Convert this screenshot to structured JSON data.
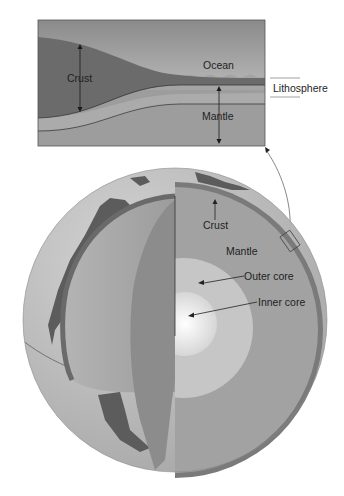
{
  "figure": {
    "inset": {
      "labels": {
        "crust": "Crust",
        "ocean": "Ocean",
        "mantle": "Mantle",
        "lithosphere": "Lithosphere"
      }
    },
    "globe": {
      "labels": {
        "crust": "Crust",
        "mantle": "Mantle",
        "outer_core": "Outer core",
        "inner_core": "Inner core"
      }
    },
    "colors": {
      "sky_top": "#8f8f8f",
      "sky_bottom": "#d8d8d8",
      "ocean": "#a5a5a5",
      "continental_crust": "#6a6a6a",
      "lithospheric_mantle": "#a8a8a8",
      "asthenosphere": "#9a9a9a",
      "globe_surface": "#bdbdbd",
      "land": "#5e5e5e",
      "mantle_section": "#a3a3a3",
      "outer_core": "#c8c8c8",
      "inner_core": "#f2f2f2"
    }
  }
}
